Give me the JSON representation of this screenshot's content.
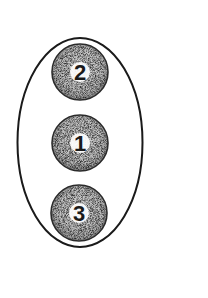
{
  "diagram": {
    "outline": {
      "shape": "ellipse",
      "cx": 80,
      "cy": 142,
      "rx": 63,
      "ry": 105,
      "stroke": "#1a1a1a"
    },
    "nodes": [
      {
        "label": "2",
        "cx": 80,
        "cy": 72,
        "r": 28
      },
      {
        "label": "1",
        "cx": 80,
        "cy": 143,
        "r": 28
      },
      {
        "label": "3",
        "cx": 79,
        "cy": 213,
        "r": 28
      }
    ],
    "colors": {
      "fill_dark": "#4a4a4a",
      "fill_light": "#9a9a9a",
      "label_bg": "#ffffff",
      "stroke": "#1a1a1a"
    }
  }
}
